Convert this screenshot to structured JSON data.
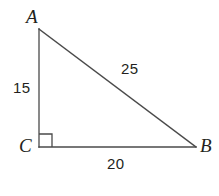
{
  "figure": {
    "kind": "right-triangle-diagram",
    "background_color": "#ffffff",
    "stroke_color": "#4a4a4a",
    "text_color": "#231f20"
  },
  "vertices": {
    "a": {
      "label": "A",
      "x": 39,
      "y": 29
    },
    "c": {
      "label": "C",
      "x": 39,
      "y": 147
    },
    "b": {
      "label": "B",
      "x": 196,
      "y": 147
    }
  },
  "sides": {
    "vertical_leg": {
      "label": "15",
      "from": "A",
      "to": "C"
    },
    "hypotenuse": {
      "label": "25",
      "from": "A",
      "to": "B"
    },
    "horizontal_leg": {
      "label": "20",
      "from": "C",
      "to": "B"
    }
  },
  "right_angle": {
    "at_vertex": "C",
    "marker": "square",
    "size": 13
  }
}
